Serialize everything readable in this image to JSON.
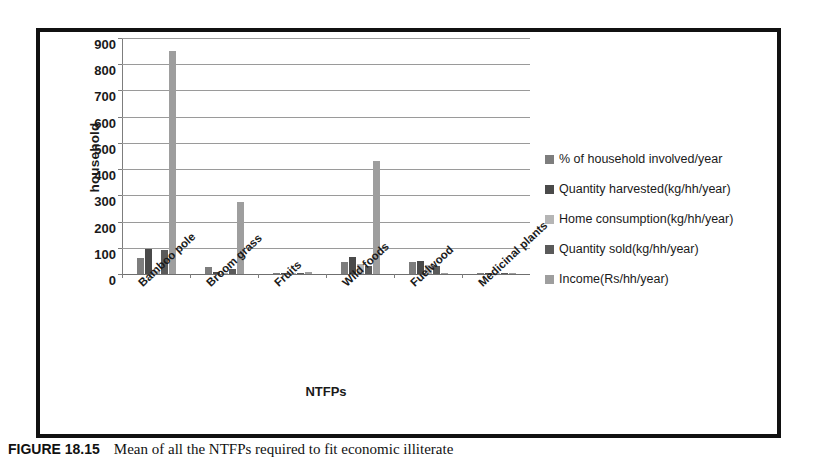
{
  "figure": {
    "caption_number": "FIGURE 18.15",
    "caption_text": "Mean of all the NTFPs required to fit economic illiterate"
  },
  "chart_data": {
    "type": "bar",
    "title": "",
    "subtitle": "",
    "xlabel": "NTFPs",
    "ylabel": "household",
    "ylim": [
      0,
      900
    ],
    "ytick_step": 100,
    "yticks": [
      "900",
      "800",
      "700",
      "600",
      "500",
      "400",
      "300",
      "200",
      "100",
      "0"
    ],
    "grid": true,
    "legend_position": "right",
    "categories": [
      "Bamboo pole",
      "Broom grass",
      "Fruits",
      "Wild foods",
      "Fuelwood",
      "Medicinal plants"
    ],
    "series": [
      {
        "name": "% of household involved/year",
        "color": "#7d7d7d",
        "values": [
          60,
          25,
          2,
          45,
          45,
          1
        ]
      },
      {
        "name": "Quantity harvested(kg/hh/year)",
        "color": "#4a4a4a",
        "values": [
          95,
          8,
          2,
          65,
          48,
          1
        ]
      },
      {
        "name": "Home consumption(kg/hh/year)",
        "color": "#b5b5b5",
        "values": [
          12,
          5,
          2,
          40,
          35,
          1
        ]
      },
      {
        "name": "Quantity sold(kg/hh/year)",
        "color": "#5a5a5a",
        "values": [
          90,
          20,
          1,
          30,
          30,
          0
        ]
      },
      {
        "name": "Income(Rs/hh/year)",
        "color": "#9e9e9e",
        "values": [
          850,
          275,
          8,
          430,
          5,
          0
        ]
      }
    ]
  }
}
